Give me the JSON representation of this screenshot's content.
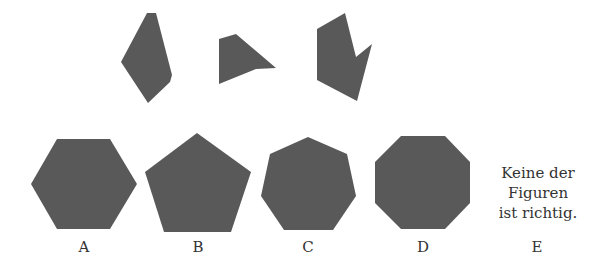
{
  "question_figures": [
    {
      "id": "piece-1",
      "points": "147,13 156,13 172,75 170,82 148,103 121,62"
    },
    {
      "id": "piece-2",
      "points": "219,39 236,34 276,68 256,69 219,84"
    },
    {
      "id": "piece-3",
      "points": "317,29 345,13 356,57 372,44 357,101 317,80"
    }
  ],
  "options": [
    {
      "label": "A",
      "shape": "hexagon",
      "points": "57,139 110,139 137,184 110,229 57,229 31,184"
    },
    {
      "label": "B",
      "shape": "pentagon",
      "points": "197,133 251,172 231,232 164,232 145,172"
    },
    {
      "label": "C",
      "shape": "heptagon",
      "points": "308,137 347,154 356,196 333,230 284,230 261,196 270,154"
    },
    {
      "label": "D",
      "shape": "octagon",
      "points": "401,136 445,136 470,162 470,203 445,229 401,229 375,203 375,162"
    },
    {
      "label": "E",
      "text_lines": [
        "Keine der",
        "Figuren",
        "ist richtig."
      ]
    }
  ],
  "colors": {
    "shape_fill": "#595959",
    "text": "#333333"
  }
}
